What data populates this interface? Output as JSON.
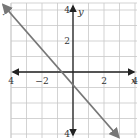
{
  "chart_data": {
    "type": "line",
    "title": "",
    "xlabel": "x",
    "ylabel": "y",
    "xlim": [
      -7,
      7
    ],
    "ylim": [
      -7,
      7
    ],
    "grid": true,
    "grid_step": 1,
    "x_ticks": [
      -6,
      -4,
      -2,
      2,
      4,
      6
    ],
    "y_ticks": [
      6,
      4,
      2,
      -4,
      -6
    ],
    "x_tick_labels": [
      "6",
      "4",
      "−2",
      "2",
      "4",
      "6"
    ],
    "y_tick_labels": [
      "6",
      "4",
      "2",
      "4",
      "6"
    ],
    "series": [
      {
        "name": "line",
        "equation": "y = -2x - 2",
        "slope": -2,
        "y_intercept": -2,
        "x_intercept": -1,
        "points": [
          [
            -4.5,
            7
          ],
          [
            3,
            -8
          ]
        ],
        "arrows": "both",
        "color": "#777777"
      }
    ]
  },
  "labels": {
    "x_axis": "x",
    "y_axis": "y",
    "marker": "·"
  }
}
